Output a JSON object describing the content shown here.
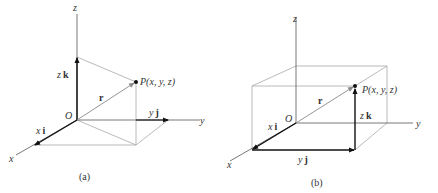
{
  "figure": {
    "panel_a": {
      "caption": "(a)",
      "axes": {
        "x": "x",
        "y": "y",
        "z": "z"
      },
      "origin_label": "O",
      "point_label": "P(x, y, z)",
      "position_vector": "r",
      "components": {
        "x": {
          "scalar": "x",
          "unit": "i"
        },
        "y": {
          "scalar": "y",
          "unit": "j"
        },
        "z": {
          "scalar": "z",
          "unit": "k"
        }
      }
    },
    "panel_b": {
      "caption": "(b)",
      "axes": {
        "x": "x",
        "y": "y",
        "z": "z"
      },
      "origin_label": "O",
      "point_label": "P(x, y, z)",
      "position_vector": "r",
      "components": {
        "x": {
          "scalar": "x",
          "unit": "i"
        },
        "y": {
          "scalar": "y",
          "unit": "j"
        },
        "z": {
          "scalar": "z",
          "unit": "k"
        }
      }
    }
  },
  "colors": {
    "axis": "#555555",
    "vector": "#111111",
    "guide": "#a8a8a8",
    "position_vector": "#8a8a8a"
  }
}
